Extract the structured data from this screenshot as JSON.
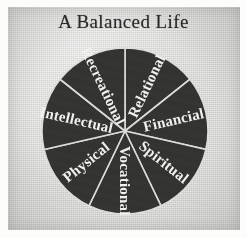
{
  "page": {
    "title": "A Balanced Life",
    "paper_color": "#d6d6d3",
    "page_color": "#fcfcfb"
  },
  "chart_data": {
    "type": "pie",
    "title": "A Balanced Life",
    "subtitle": "",
    "xlabel": "",
    "ylabel": "",
    "legend": "none",
    "grid": false,
    "slice_color": "#333331",
    "divider_color": "#dcdcd8",
    "label_color": "#f2f1ec",
    "start_angle_deg": 0,
    "total_slices": 7,
    "equal_slices": true,
    "slice_angle_deg": 51.43,
    "categories": [
      "Relational",
      "Financial",
      "Spiritual",
      "Vocational",
      "Physical",
      "Intellectual",
      "Recreational"
    ],
    "values": [
      14.29,
      14.29,
      14.29,
      14.29,
      14.29,
      14.29,
      14.29
    ],
    "slices": [
      {
        "label": "Relational",
        "value": 14.29,
        "start_deg": 0.0,
        "end_deg": 51.43,
        "mid_deg": 25.7
      },
      {
        "label": "Financial",
        "value": 14.29,
        "start_deg": 51.43,
        "end_deg": 102.86,
        "mid_deg": 77.1
      },
      {
        "label": "Spiritual",
        "value": 14.29,
        "start_deg": 102.86,
        "end_deg": 154.29,
        "mid_deg": 128.6
      },
      {
        "label": "Vocational",
        "value": 14.29,
        "start_deg": 154.29,
        "end_deg": 205.71,
        "mid_deg": 180.0
      },
      {
        "label": "Physical",
        "value": 14.29,
        "start_deg": 205.71,
        "end_deg": 257.14,
        "mid_deg": 231.4
      },
      {
        "label": "Intellectual",
        "value": 14.29,
        "start_deg": 257.14,
        "end_deg": 308.57,
        "mid_deg": 282.9
      },
      {
        "label": "Recreational",
        "value": 14.29,
        "start_deg": 308.57,
        "end_deg": 360.0,
        "mid_deg": 334.3
      }
    ]
  }
}
